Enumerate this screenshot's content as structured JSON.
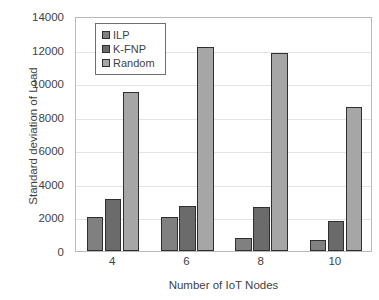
{
  "chart_data": {
    "type": "bar",
    "title": "",
    "xlabel": "Number of IoT Nodes",
    "ylabel": "Standard deviation of Load",
    "categories": [
      "4",
      "6",
      "8",
      "10"
    ],
    "series": [
      {
        "name": "ILP",
        "color": "#808080",
        "values": [
          2050,
          2000,
          750,
          680
        ]
      },
      {
        "name": "K-FNP",
        "color": "#6b6b6b",
        "values": [
          3100,
          2700,
          2600,
          1800
        ]
      },
      {
        "name": "Random",
        "color": "#a6a6a6",
        "values": [
          9450,
          12150,
          11800,
          8550
        ]
      }
    ],
    "ylim": [
      0,
      14000
    ],
    "ytick_values": [
      0,
      2000,
      4000,
      6000,
      8000,
      10000,
      12000,
      14000
    ],
    "ytick_labels": [
      "0",
      "2000",
      "4000",
      "6000",
      "8000",
      "10000",
      "12000",
      "14000"
    ],
    "grid": "horizontal",
    "legend_position": "top-left-inside",
    "bar_outline_color": "#2f2f2f",
    "plot_border_color": "#b9b9b9",
    "gridline_color": "#e3e3e3"
  },
  "caption_remnant": " "
}
